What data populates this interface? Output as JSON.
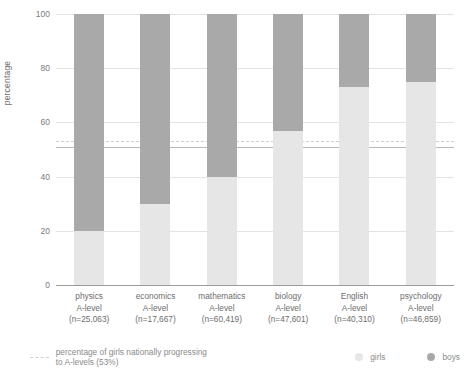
{
  "chart_data": {
    "type": "bar",
    "subtype": "stacked-100-percent",
    "title": "",
    "xlabel": "",
    "ylabel": "percentage",
    "ylim": [
      0,
      100
    ],
    "yticks": [
      0,
      20,
      40,
      60,
      80,
      100
    ],
    "grid": true,
    "legend_position": "bottom",
    "categories": [
      "physics A-level (n=25,063)",
      "economics A-level (n=17,667)",
      "mathematics A-level (n=60,419)",
      "biology A-level (n=47,601)",
      "English A-level (n=40,310)",
      "psychology A-level (n=46,859)"
    ],
    "series": [
      {
        "name": "girls",
        "color": "#e6e6e6",
        "values": [
          20,
          30,
          40,
          57,
          73,
          75
        ]
      },
      {
        "name": "boys",
        "color": "#a9a9a9",
        "values": [
          80,
          70,
          60,
          43,
          27,
          25
        ]
      }
    ],
    "reference_line": {
      "label": "percentage of girls nationally progressing to A-levels (53%)",
      "value": 53,
      "style": "dashed",
      "color": "#cfcfcf"
    }
  },
  "axis": {
    "ylabel": "percentage",
    "yticks": [
      "100",
      "80",
      "60",
      "40",
      "20",
      "0"
    ]
  },
  "bars": [
    {
      "subject": "physics",
      "line2": "A-level",
      "n": "(n=25,063)",
      "girls": 20,
      "boys": 80
    },
    {
      "subject": "economics",
      "line2": "A-level",
      "n": "(n=17,667)",
      "girls": 30,
      "boys": 70
    },
    {
      "subject": "mathematics",
      "line2": "A-level",
      "n": "(n=60,419)",
      "girls": 40,
      "boys": 60
    },
    {
      "subject": "biology",
      "line2": "A-level",
      "n": "(n=47,601)",
      "girls": 57,
      "boys": 43
    },
    {
      "subject": "English",
      "line2": "A-level",
      "n": "(n=40,310)",
      "girls": 73,
      "boys": 27
    },
    {
      "subject": "psychology",
      "line2": "A-level",
      "n": "(n=46,859)",
      "girls": 75,
      "boys": 25
    }
  ],
  "legend": {
    "reference_text": "percentage of girls nationally progressing to A-levels (53%)",
    "girls_label": "girls",
    "boys_label": "boys"
  },
  "colors": {
    "girls": "#e6e6e6",
    "boys": "#a9a9a9",
    "reference_line": "#cfcfcf",
    "grid": "#e3e3e3",
    "axis": "#9b9b9b",
    "text": "#6d6d6d"
  }
}
